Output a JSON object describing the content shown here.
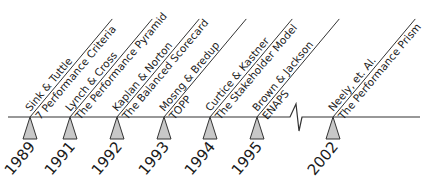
{
  "colors": {
    "line": "#333333",
    "marker_fill": "#c8c8c8",
    "marker_stroke": "#333333",
    "text": "#1a1a1a"
  },
  "timeline": {
    "events": [
      {
        "year": "1989",
        "author": "Sink & Tuttle",
        "framework": "7 Performance Criteria",
        "x": 30
      },
      {
        "year": "1991",
        "author": "Lynch & Cross",
        "framework": "The Performance Pyramid",
        "x": 70
      },
      {
        "year": "1992",
        "author": "Kaplan & Norton",
        "framework": "The Balanced Scorecard",
        "x": 117
      },
      {
        "year": "1993",
        "author": "Mosng & Bredup",
        "framework": "TOPP",
        "x": 164
      },
      {
        "year": "1994",
        "author": "Curtice & Kastner",
        "framework": "The Stakeholder Model",
        "x": 210
      },
      {
        "year": "1995",
        "author": "Brown & Jackson",
        "framework": "ENAPS",
        "x": 257
      },
      {
        "year": "2002",
        "author": "Neely, et. Al.",
        "framework": "The Performance Prism",
        "x": 333
      }
    ],
    "break_marker": "axis-break"
  }
}
